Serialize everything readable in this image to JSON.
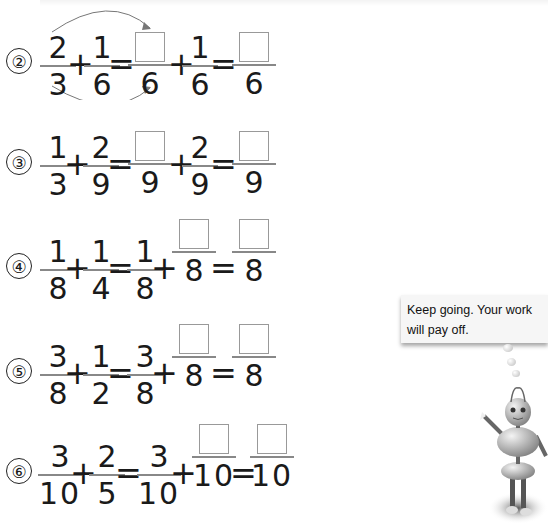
{
  "worksheet": {
    "problems": [
      {
        "label": "②",
        "a": {
          "n": "2",
          "d": "3"
        },
        "b": {
          "n": "1",
          "d": "6"
        },
        "step1": {
          "left": {
            "n": "",
            "d": "6"
          },
          "right": {
            "n": "1",
            "d": "6"
          }
        },
        "result": {
          "n": "",
          "d": "6"
        },
        "ops": [
          "+",
          "=",
          "+",
          "="
        ],
        "has_arrows": true
      },
      {
        "label": "③",
        "a": {
          "n": "1",
          "d": "3"
        },
        "b": {
          "n": "2",
          "d": "9"
        },
        "step1": {
          "left": {
            "n": "",
            "d": "9"
          },
          "right": {
            "n": "2",
            "d": "9"
          }
        },
        "result": {
          "n": "",
          "d": "9"
        },
        "ops": [
          "+",
          "=",
          "+",
          "="
        ]
      },
      {
        "label": "④",
        "a": {
          "n": "1",
          "d": "8"
        },
        "b": {
          "n": "1",
          "d": "4"
        },
        "step1": {
          "left": {
            "n": "1",
            "d": "8"
          },
          "right": {
            "n": "",
            "d": "8"
          }
        },
        "result": {
          "n": "",
          "d": "8"
        },
        "ops": [
          "+",
          "=",
          "+",
          "="
        ]
      },
      {
        "label": "⑤",
        "a": {
          "n": "3",
          "d": "8"
        },
        "b": {
          "n": "1",
          "d": "2"
        },
        "step1": {
          "left": {
            "n": "3",
            "d": "8"
          },
          "right": {
            "n": "",
            "d": "8"
          }
        },
        "result": {
          "n": "",
          "d": "8"
        },
        "ops": [
          "+",
          "=",
          "+",
          "="
        ]
      },
      {
        "label": "⑥",
        "a": {
          "n": "3",
          "d": "10"
        },
        "b": {
          "n": "2",
          "d": "5"
        },
        "step1": {
          "left": {
            "n": "3",
            "d": "10"
          },
          "right": {
            "n": "",
            "d": "10"
          }
        },
        "result": {
          "n": "",
          "d": "10"
        },
        "ops": [
          "+",
          "=",
          "+",
          "="
        ]
      }
    ]
  },
  "mascot": {
    "speech": "Keep going. Your work will pay off.",
    "icon": "robot-mascot-icon"
  }
}
